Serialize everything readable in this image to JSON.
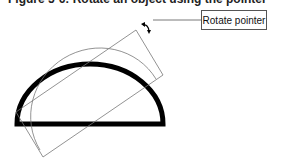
{
  "figure": {
    "title": "Figure 5-6: Rotate an object using the pointer",
    "callout_label": "Rotate pointer"
  },
  "icons": {
    "rotate_pointer": "rotate-pointer-icon"
  },
  "colors": {
    "shape_stroke": "#000000",
    "outline_stroke": "#777777",
    "callout_border": "#555555"
  }
}
